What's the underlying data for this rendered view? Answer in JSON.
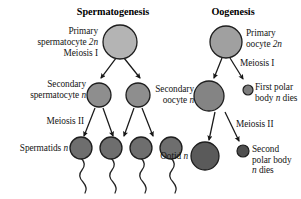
{
  "figure": {
    "background_color": "#ffffff",
    "panels": [
      {
        "id": "spermatogenesis",
        "title": "Spermatogenesis",
        "stages": [
          {
            "id": "primary-spermatocyte",
            "label_line1": "Primary",
            "label_line2": "spermatocyte 2n",
            "ploidy": "2n",
            "cell_count": 1,
            "cell_fill": "#b4b4b4"
          },
          {
            "id": "secondary-spermatocyte",
            "label_line1": "Secondary",
            "label_line2": "spermatocyte n",
            "ploidy": "n",
            "cell_count": 2,
            "cell_fill": "#8e8e8e"
          },
          {
            "id": "spermatids",
            "label_line1": "Spermatids n",
            "label_line2": "",
            "ploidy": "n",
            "cell_count": 4,
            "cell_fill": "#6e6e6e"
          }
        ],
        "divisions": [
          {
            "id": "meiosis-1",
            "label": "Meiosis I"
          },
          {
            "id": "meiosis-2",
            "label": "Meiosis II"
          }
        ]
      },
      {
        "id": "oogenesis",
        "title": "Oogenesis",
        "stages": [
          {
            "id": "primary-oocyte",
            "label_line1": "Primary",
            "label_line2": "oocyte 2n",
            "ploidy": "2n",
            "cell_count": 1,
            "cell_fill": "#a0a0a0"
          },
          {
            "id": "secondary-oocyte",
            "label_line1": "Secondary",
            "label_line2": "oocyte n",
            "ploidy": "n",
            "cell_count": 1,
            "cell_fill": "#848484"
          },
          {
            "id": "first-polar-body",
            "label_line1": "First polar",
            "label_line2": "body n dies",
            "ploidy": "n",
            "cell_count": 1,
            "cell_fill": "#7d7d7d"
          },
          {
            "id": "ootid",
            "label_line1": "Ootid n",
            "label_line2": "",
            "ploidy": "n",
            "cell_count": 1,
            "cell_fill": "#5a5a5a"
          },
          {
            "id": "second-polar-body",
            "label_line1": "Second",
            "label_line2": "polar body",
            "label_line3": "n dies",
            "ploidy": "n",
            "cell_count": 1,
            "cell_fill": "#4f4f4f"
          }
        ],
        "divisions": [
          {
            "id": "meiosis-1",
            "label": "Meiosis I"
          },
          {
            "id": "meiosis-2",
            "label": "Meiosis II"
          }
        ]
      }
    ]
  },
  "chart_data": {
    "type": "diagram",
    "panels": [
      "Spermatogenesis",
      "Oogenesis"
    ],
    "spermatogenesis_products": 4,
    "oogenesis_functional_products": 1,
    "oogenesis_polar_bodies": 2
  }
}
